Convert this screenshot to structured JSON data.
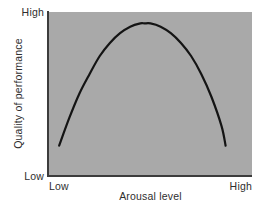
{
  "figure": {
    "background_color": "#ffffff",
    "panel_color": "#a9a9a9",
    "axis_color": "#3c3c3c",
    "curve_color": "#141414"
  },
  "axes": {
    "y_title": "Quality of performance",
    "y_high_label": "High",
    "y_low_label": "Low",
    "x_title": "Arousal level",
    "x_low_label": "Low",
    "x_high_label": "High"
  },
  "chart_data": {
    "type": "line",
    "title": "",
    "subtitle": "",
    "xlabel": "Arousal level",
    "ylabel": "Quality of performance",
    "xlim": [
      0,
      100
    ],
    "ylim": [
      0,
      100
    ],
    "xtick_labels": [
      "Low",
      "High"
    ],
    "ytick_labels": [
      "Low",
      "High"
    ],
    "grid": false,
    "legend": false,
    "legend_position": "none",
    "annotations": [],
    "series": [
      {
        "name": "Performance",
        "style": "smooth-curve",
        "color": "#141414",
        "line_width": 2.2,
        "x": [
          5,
          10,
          15,
          20,
          25,
          30,
          35,
          40,
          45,
          47,
          50,
          55,
          60,
          65,
          70,
          75,
          80,
          85,
          87
        ],
        "y": [
          18,
          35,
          50,
          62,
          73,
          81,
          87,
          91,
          93,
          93,
          93,
          91,
          87,
          81,
          73,
          62,
          48,
          30,
          18
        ]
      }
    ]
  }
}
